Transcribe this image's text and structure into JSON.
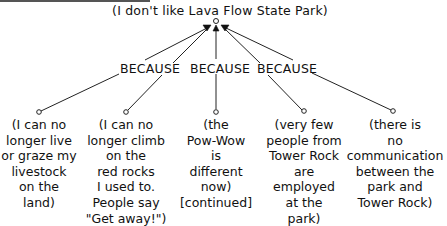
{
  "diagram": {
    "root": {
      "text": "(I don't like Lava Flow State Park)"
    },
    "connector_label": "BECAUSE",
    "connectors": [
      {
        "label": "BECAUSE"
      },
      {
        "label": "BECAUSE"
      },
      {
        "label": "BECAUSE"
      }
    ],
    "reasons": [
      {
        "text": "(I can no\nlonger live\nor graze my\nlivestock\non the\nland)"
      },
      {
        "text": "(I can no\nlonger climb\non the\nred rocks\nI used to.\nPeople say\n\"Get away!\")"
      },
      {
        "text": "(the\nPow-Wow\nis\ndifferent\nnow)\n[continued]"
      },
      {
        "text": "(very few\npeople from\nTower Rock\nare\nemployed\nat the\npark)"
      },
      {
        "text": "(there is\nno\ncommunication\nbetween the\npark and\nTower Rock)"
      }
    ],
    "colors": {
      "line": "#222222",
      "text": "#111111",
      "background": "#ffffff"
    }
  }
}
